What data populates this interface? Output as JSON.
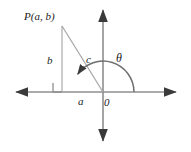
{
  "figure": {
    "kind": "geometry-diagram",
    "background_color": "#ffffff",
    "stroke_color": "#8a8a8a",
    "text_color": "#1a1a1a",
    "width": 191,
    "height": 152
  },
  "labels": {
    "point": "P(a, b)",
    "vertical_leg": "b",
    "hypotenuse": "c",
    "horizontal_leg": "a",
    "origin": "0",
    "angle": "θ"
  },
  "geometry": {
    "origin": {
      "x": 103,
      "y": 92
    },
    "point_p": {
      "x": 62,
      "y": 26
    },
    "foot": {
      "x": 62,
      "y": 92
    },
    "x_axis": {
      "x1": 12,
      "y1": 92,
      "x2": 180,
      "y2": 92
    },
    "y_axis": {
      "x1": 103,
      "y1": 6,
      "x2": 103,
      "y2": 145
    },
    "arc_radius": 31,
    "arc_start_deg": 0,
    "arc_end_deg": 148,
    "right_angle_marker": {
      "x": 53,
      "y": 83,
      "size": 9
    }
  }
}
